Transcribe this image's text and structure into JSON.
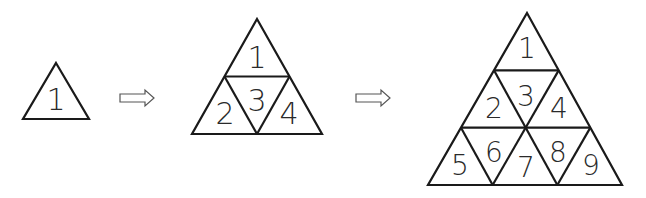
{
  "figures": [
    {
      "name": "stage-1",
      "rows": 1,
      "apex": [
        56,
        63
      ],
      "base_y": 119,
      "base_left": 23,
      "base_right": 89,
      "labels": [
        {
          "text": "1",
          "x": 56,
          "y": 99,
          "size": 30
        }
      ]
    },
    {
      "name": "stage-2",
      "rows": 2,
      "apex": [
        257,
        19
      ],
      "base_y": 134,
      "base_left": 192,
      "base_right": 322,
      "labels": [
        {
          "text": "1",
          "x": 257,
          "y": 57,
          "size": 30
        },
        {
          "text": "2",
          "x": 225,
          "y": 113,
          "size": 30
        },
        {
          "text": "3",
          "x": 257,
          "y": 100,
          "size": 30
        },
        {
          "text": "4",
          "x": 289,
          "y": 113,
          "size": 30
        }
      ]
    },
    {
      "name": "stage-3",
      "rows": 3,
      "apex": [
        527,
        13
      ],
      "base_y": 185,
      "base_left": 428,
      "base_right": 622,
      "labels": [
        {
          "text": "1",
          "x": 527,
          "y": 48,
          "size": 28
        },
        {
          "text": "2",
          "x": 494,
          "y": 108,
          "size": 28
        },
        {
          "text": "3",
          "x": 526,
          "y": 96,
          "size": 28
        },
        {
          "text": "4",
          "x": 559,
          "y": 108,
          "size": 28
        },
        {
          "text": "5",
          "x": 460,
          "y": 165,
          "size": 28
        },
        {
          "text": "6",
          "x": 494,
          "y": 152,
          "size": 28
        },
        {
          "text": "7",
          "x": 526,
          "y": 167,
          "size": 28
        },
        {
          "text": "8",
          "x": 558,
          "y": 152,
          "size": 28
        },
        {
          "text": "9",
          "x": 591,
          "y": 165,
          "size": 28
        }
      ]
    }
  ],
  "arrows": [
    {
      "name": "arrow-1-to-2",
      "x": 120,
      "y": 98,
      "length": 34
    },
    {
      "name": "arrow-2-to-3",
      "x": 356,
      "y": 98,
      "length": 34
    }
  ]
}
